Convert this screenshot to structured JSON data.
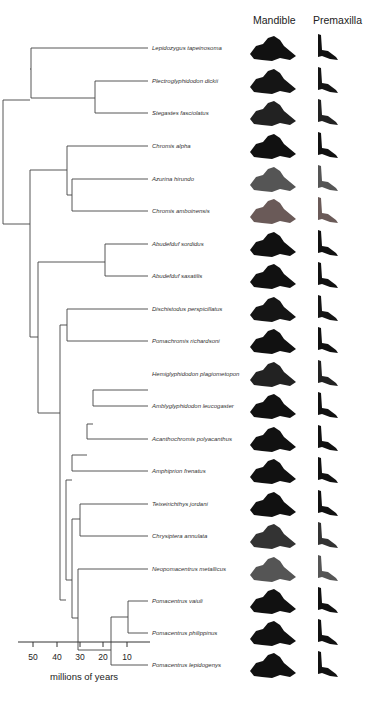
{
  "headers": {
    "mandible": "Mandible",
    "premaxilla": "Premaxilla"
  },
  "taxa": [
    {
      "name": "Lepidozygus tapeinosoma",
      "y": 48,
      "tone": "#111"
    },
    {
      "name": "Plectroglyphidodon dickii",
      "y": 81,
      "tone": "#151515"
    },
    {
      "name": "Stegastes fasciolatus",
      "y": 113,
      "tone": "#222"
    },
    {
      "name": "Chromis alpha",
      "y": 146,
      "tone": "#111"
    },
    {
      "name": "Azurina hirundo",
      "y": 179,
      "tone": "#555"
    },
    {
      "name": "Chromis amboinensis",
      "y": 211,
      "tone": "#6a5a58"
    },
    {
      "name": "Abudefduf sordidus",
      "y": 244,
      "tone": "#111"
    },
    {
      "name": "Abudefduf saxatilis",
      "y": 276,
      "tone": "#111"
    },
    {
      "name": "Dischistodus perspicillatus",
      "y": 309,
      "tone": "#151515"
    },
    {
      "name": "Pomachromis richardsoni",
      "y": 341,
      "tone": "#111"
    },
    {
      "name": "Hemiglyphidodon plagiometopon",
      "y": 374,
      "tone": "#222"
    },
    {
      "name": "Amblyglyphidodon leucogaster",
      "y": 406,
      "tone": "#111"
    },
    {
      "name": "Acanthochromis polyacanthus",
      "y": 439,
      "tone": "#111"
    },
    {
      "name": "Amphiprion frenatus",
      "y": 471,
      "tone": "#111"
    },
    {
      "name": "Teixeirichthys jordani",
      "y": 504,
      "tone": "#111"
    },
    {
      "name": "Chrysiptera annulata",
      "y": 536,
      "tone": "#333"
    },
    {
      "name": "Neopomacentrus metallicus",
      "y": 569,
      "tone": "#555"
    },
    {
      "name": "Pomacentrus vaiuli",
      "y": 601,
      "tone": "#111"
    },
    {
      "name": "Pomacentrus philippinus",
      "y": 633,
      "tone": "#111"
    },
    {
      "name": "Pomacentrus lepidogenys",
      "y": 665,
      "tone": "#111"
    }
  ],
  "axis": {
    "label": "millions of years",
    "ticks": [
      {
        "label": "50",
        "x": 33
      },
      {
        "label": "40",
        "x": 57
      },
      {
        "label": "30",
        "x": 80
      },
      {
        "label": "20",
        "x": 103
      },
      {
        "label": "10",
        "x": 127
      }
    ]
  },
  "tree_edges": [
    [
      3,
      100,
      30,
      100
    ],
    [
      3,
      100,
      3,
      224
    ],
    [
      3,
      224,
      30,
      224
    ],
    [
      30,
      69,
      31,
      69
    ],
    [
      31,
      69,
      31,
      48
    ],
    [
      31,
      48,
      148,
      48
    ],
    [
      31,
      69,
      31,
      98
    ],
    [
      31,
      98,
      95,
      98
    ],
    [
      95,
      81,
      95,
      113
    ],
    [
      95,
      81,
      148,
      81
    ],
    [
      95,
      113,
      148,
      113
    ],
    [
      30,
      224,
      30,
      170
    ],
    [
      30,
      170,
      67,
      170
    ],
    [
      67,
      146,
      67,
      195
    ],
    [
      67,
      146,
      148,
      146
    ],
    [
      67,
      195,
      72,
      195
    ],
    [
      72,
      179,
      72,
      211
    ],
    [
      72,
      179,
      148,
      179
    ],
    [
      72,
      211,
      148,
      211
    ],
    [
      30,
      224,
      30,
      337
    ],
    [
      30,
      337,
      38,
      337
    ],
    [
      38,
      262,
      38,
      413
    ],
    [
      38,
      262,
      105,
      262
    ],
    [
      105,
      244,
      105,
      276
    ],
    [
      105,
      244,
      148,
      244
    ],
    [
      105,
      276,
      148,
      276
    ],
    [
      38,
      413,
      60,
      413
    ],
    [
      60,
      325,
      60,
      600
    ],
    [
      60,
      325,
      67,
      325
    ],
    [
      67,
      309,
      67,
      341
    ],
    [
      67,
      309,
      148,
      309
    ],
    [
      67,
      341,
      148,
      341
    ],
    [
      60,
      600,
      66,
      600
    ],
    [
      66,
      480,
      66,
      580
    ],
    [
      66,
      480,
      72,
      480
    ],
    [
      72,
      455,
      72,
      471
    ],
    [
      72,
      471,
      148,
      471
    ],
    [
      72,
      455,
      87,
      455
    ],
    [
      87,
      424,
      87,
      439
    ],
    [
      87,
      439,
      148,
      439
    ],
    [
      87,
      424,
      93,
      424
    ],
    [
      93,
      390,
      93,
      406
    ],
    [
      93,
      390,
      148,
      390
    ],
    [
      93,
      406,
      148,
      406
    ],
    [
      66,
      580,
      72,
      580
    ],
    [
      72,
      519,
      72,
      618
    ],
    [
      72,
      519,
      80,
      519
    ],
    [
      80,
      504,
      80,
      536
    ],
    [
      80,
      504,
      148,
      504
    ],
    [
      80,
      536,
      148,
      536
    ],
    [
      72,
      618,
      78,
      618
    ],
    [
      78,
      569,
      78,
      650
    ],
    [
      78,
      569,
      148,
      569
    ],
    [
      78,
      650,
      111,
      650
    ],
    [
      111,
      617,
      111,
      665
    ],
    [
      111,
      617,
      128,
      617
    ],
    [
      128,
      601,
      128,
      633
    ],
    [
      128,
      601,
      148,
      601
    ],
    [
      128,
      633,
      148,
      633
    ],
    [
      111,
      665,
      148,
      665
    ]
  ]
}
